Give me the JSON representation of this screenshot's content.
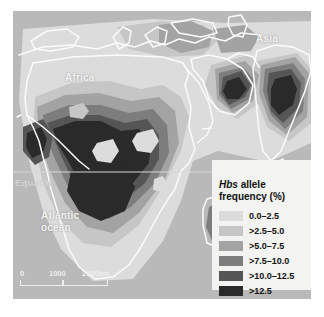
{
  "figure": {
    "kind": "choropleth-map",
    "region": "Africa, southern Europe, Middle East and South Asia",
    "background_color": "#ffffff",
    "ocean_color": "#b9b9b9",
    "coastline_color": "#fbfbfb"
  },
  "map_labels": {
    "africa": "Africa",
    "asia": "Asia",
    "atlantic": "Atlantic\nocean",
    "equator": "Equator"
  },
  "scalebar": {
    "start": "0",
    "mid": "1000",
    "end": "2000km"
  },
  "legend": {
    "title_italic": "Hbs",
    "title_rest": " allele\nfrequency (%)",
    "entries": [
      {
        "label": "0.0–2.5",
        "color": "#dcdcdc"
      },
      {
        "label": ">2.5–5.0",
        "color": "#c6c6c6"
      },
      {
        "label": ">5.0–7.5",
        "color": "#a3a3a3"
      },
      {
        "label": ">7.5–10.0",
        "color": "#7d7d7d"
      },
      {
        "label": ">10.0–12.5",
        "color": "#555555"
      },
      {
        "label": ">12.5",
        "color": "#2a2a2a"
      }
    ]
  },
  "chart_data": {
    "type": "heatmap",
    "title": "Hbs allele frequency (%)",
    "variable": "Hbs allele frequency",
    "units": "%",
    "bins": [
      "0.0–2.5",
      ">2.5–5.0",
      ">5.0–7.5",
      ">7.5–10.0",
      ">10.0–12.5",
      ">12.5"
    ],
    "bin_colors": [
      "#dcdcdc",
      "#c6c6c6",
      "#a3a3a3",
      "#7d7d7d",
      "#555555",
      "#2a2a2a"
    ],
    "legend_position": "bottom-right",
    "grid": false,
    "annotations": [
      "Africa",
      "Asia",
      "Atlantic ocean",
      "Equator"
    ],
    "regions": [
      {
        "name": "Southern Europe / Mediterranean",
        "bin": ">2.5–5.0"
      },
      {
        "name": "Greece and Turkey",
        "bin": ">5.0–7.5"
      },
      {
        "name": "Sahara / North Africa",
        "bin": "0.0–2.5"
      },
      {
        "name": "West Africa coast (Senegal–Guinea)",
        "bin": ">10.0–12.5"
      },
      {
        "name": "Sahel belt",
        "bin": ">5.0–7.5"
      },
      {
        "name": "Central Africa / Congo basin",
        "bin": ">12.5"
      },
      {
        "name": "East Africa lakes region",
        "bin": ">7.5–10.0"
      },
      {
        "name": "Southern Africa",
        "bin": "0.0–2.5"
      },
      {
        "name": "Madagascar",
        "bin": ">7.5–10.0"
      },
      {
        "name": "Arabian peninsula (eastern)",
        "bin": ">12.5"
      },
      {
        "name": "Central India",
        "bin": ">12.5"
      },
      {
        "name": "Northern India",
        "bin": ">5.0–7.5"
      }
    ]
  }
}
